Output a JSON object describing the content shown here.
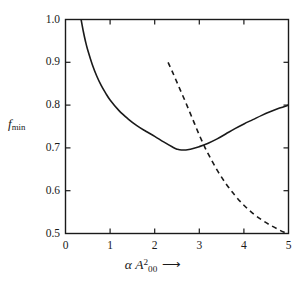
{
  "figure": {
    "background_color": "#ffffff",
    "axis_color": "#1a1a1a",
    "curve_color": "#1a1a1a"
  },
  "axes": {
    "ylabel_main": "f",
    "ylabel_sub": "min",
    "xlabel_greek": "α",
    "xlabel_var": "A",
    "xlabel_sup": "2",
    "xlabel_sub": "00",
    "xlabel_arrow": "⟶",
    "xticks": [
      {
        "value": 0,
        "label": "0"
      },
      {
        "value": 1,
        "label": "1"
      },
      {
        "value": 2,
        "label": "2"
      },
      {
        "value": 3,
        "label": "3"
      },
      {
        "value": 4,
        "label": "4"
      },
      {
        "value": 5,
        "label": "5"
      }
    ],
    "yticks": [
      {
        "value": 0.5,
        "label": "0.5"
      },
      {
        "value": 0.6,
        "label": "0.6"
      },
      {
        "value": 0.7,
        "label": "0.7"
      },
      {
        "value": 0.8,
        "label": "0.8"
      },
      {
        "value": 0.9,
        "label": "0.9"
      },
      {
        "value": 1.0,
        "label": "1.0"
      }
    ]
  },
  "chart_data": {
    "type": "line",
    "title": "",
    "subtitle": "",
    "xlabel": "α A²₀₀ ⟶",
    "ylabel": "f_min",
    "xlim": [
      0,
      5
    ],
    "ylim": [
      0.5,
      1.0
    ],
    "xticks": [
      0,
      1,
      2,
      3,
      4,
      5
    ],
    "yticks": [
      0.5,
      0.6,
      0.7,
      0.8,
      0.9,
      1.0
    ],
    "grid": false,
    "legend": null,
    "legend_position": "none",
    "tick_direction": "in",
    "ticks_all_sides": true,
    "frame": "box",
    "series": [
      {
        "name": "f_min-solid",
        "style": "solid",
        "color": "#1a1a1a",
        "linewidth": 1.6,
        "x": [
          0.35,
          0.4,
          0.45,
          0.5,
          0.6,
          0.7,
          0.8,
          0.9,
          1.0,
          1.2,
          1.4,
          1.6,
          1.8,
          2.0,
          2.2,
          2.4,
          2.5,
          2.6,
          2.8,
          3.0,
          3.2,
          3.4,
          3.6,
          3.8,
          4.0,
          4.2,
          4.4,
          4.6,
          4.8,
          5.0
        ],
        "y": [
          1.0,
          0.972,
          0.948,
          0.928,
          0.895,
          0.868,
          0.846,
          0.828,
          0.812,
          0.787,
          0.768,
          0.752,
          0.739,
          0.727,
          0.714,
          0.702,
          0.697,
          0.695,
          0.697,
          0.703,
          0.711,
          0.721,
          0.733,
          0.745,
          0.756,
          0.766,
          0.776,
          0.785,
          0.793,
          0.8
        ]
      },
      {
        "name": "f_min-dashed",
        "style": "dashed",
        "color": "#1a1a1a",
        "linewidth": 1.6,
        "dash_pattern": [
          5,
          4
        ],
        "x": [
          2.3,
          2.4,
          2.5,
          2.6,
          2.7,
          2.8,
          2.9,
          3.0,
          3.1,
          3.2,
          3.4,
          3.6,
          3.8,
          4.0,
          4.2,
          4.4,
          4.6,
          4.8,
          4.92
        ],
        "y": [
          0.9,
          0.877,
          0.853,
          0.829,
          0.805,
          0.78,
          0.755,
          0.73,
          0.707,
          0.686,
          0.648,
          0.616,
          0.589,
          0.566,
          0.547,
          0.532,
          0.519,
          0.508,
          0.502
        ]
      }
    ],
    "annotations": [
      {
        "text": "curves intersect",
        "x": 3.0,
        "y": 0.7
      }
    ]
  }
}
